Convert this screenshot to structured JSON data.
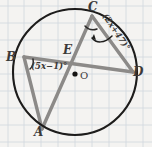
{
  "figure": {
    "kind": "circle-geometry-diagram",
    "background": "graph-paper",
    "colors": {
      "paper": "#f4f3f1",
      "grid": "#cfd6dd",
      "circle_stroke": "#1d1c1b",
      "chord_stroke": "#8c8a88",
      "label_text": "#3c3a39",
      "arc_stroke": "#2a2928",
      "arrow_stroke": "#1d1c1b",
      "center_dot": "#151413"
    },
    "circle": {
      "center_label": "O",
      "center_dot": "●",
      "cx": 75,
      "cy": 72,
      "r": 62
    },
    "points": [
      {
        "id": "A",
        "label": "A",
        "x": 42,
        "y": 129
      },
      {
        "id": "B",
        "label": "B",
        "x": 24,
        "y": 57
      },
      {
        "id": "C",
        "label": "C",
        "x": 92,
        "y": 16
      },
      {
        "id": "D",
        "label": "D",
        "x": 133,
        "y": 72
      },
      {
        "id": "E",
        "label": "E",
        "x": 70,
        "y": 56
      }
    ],
    "chords": [
      {
        "from": "B",
        "to": "D",
        "through": "E"
      },
      {
        "from": "C",
        "to": "A",
        "through": "E"
      },
      {
        "from": "B",
        "to": "A"
      },
      {
        "from": "C",
        "to": "D"
      }
    ],
    "angles": [
      {
        "vertex": "B",
        "name": "angle-at-b",
        "label": "(5x−1)°",
        "marker": "arc"
      },
      {
        "vertex": "C",
        "name": "angle-at-c",
        "label": "(2x+47)°",
        "marker": "arc",
        "callout": "curved-arrow",
        "label_rotation_deg": 56
      }
    ]
  }
}
